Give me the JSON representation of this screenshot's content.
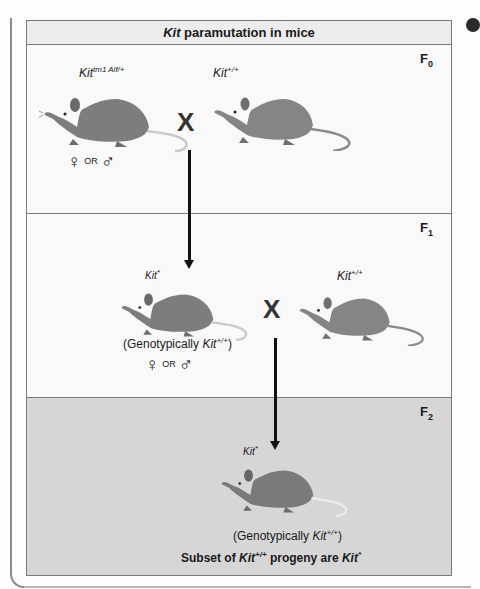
{
  "figure": {
    "title_italic": "Kit",
    "title_rest": " paramutation in mice"
  },
  "generations": [
    {
      "label": "F",
      "subscript": "0"
    },
    {
      "label": "F",
      "subscript": "1"
    },
    {
      "label": "F",
      "subscript": "2"
    }
  ],
  "f0": {
    "mouse_left": {
      "genotype_base": "Kit",
      "genotype_sup": "tm1 Alf/+",
      "color": "#7d7d7d"
    },
    "mouse_right": {
      "genotype_base": "Kit",
      "genotype_sup": "+/+",
      "color": "#858585"
    },
    "cross_symbol": "X",
    "sex": {
      "female": "♀",
      "or": "OR",
      "male": "♂"
    }
  },
  "f1": {
    "mouse_left": {
      "genotype_base": "Kit",
      "genotype_sup": "*",
      "color": "#7d7d7d"
    },
    "mouse_right": {
      "genotype_base": "Kit",
      "genotype_sup": "+/+",
      "color": "#858585"
    },
    "cross_symbol": "X",
    "caption_pre": "(Genotypically ",
    "caption_base": "Kit",
    "caption_sup": "+/+",
    "caption_post": ")",
    "sex": {
      "female": "♀",
      "or": "OR",
      "male": "♂"
    }
  },
  "f2": {
    "mouse": {
      "genotype_base": "Kit",
      "genotype_sup": "*",
      "color": "#7a7a7a"
    },
    "caption_pre": "(Genotypically ",
    "caption_base": "Kit",
    "caption_sup": "+/+",
    "caption_post": ")",
    "summary_pre": "Subset of ",
    "summary_base1": "Kit",
    "summary_sup1": "+/+",
    "summary_mid": " progeny are ",
    "summary_base2": "Kit",
    "summary_sup2": "*"
  },
  "colors": {
    "panel_light": "#f9f9f9",
    "panel_f2": "#d6d6d6",
    "border": "#7a7a7a",
    "arrow": "#111111"
  }
}
